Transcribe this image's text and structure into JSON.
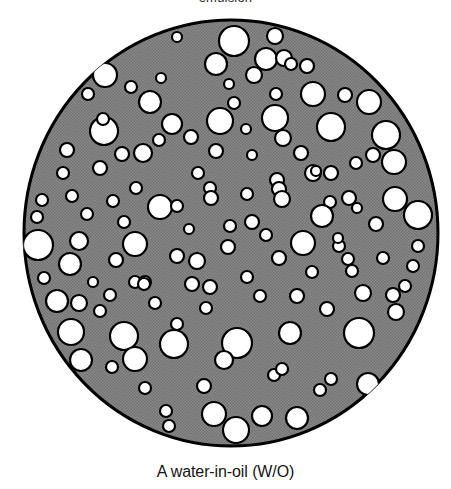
{
  "figure": {
    "top_label": "emulsion",
    "caption": "A water-in-oil (W/O)",
    "alt_description": "A water-in-oil (W/O) emulsion: gray continuous oil phase disc containing dispersed white water droplets"
  },
  "colors": {
    "continuous_phase_gray": "#878787",
    "halftone_dark": "#6e6e6e",
    "outline_black": "#000000",
    "droplet_white": "#ffffff",
    "page_background": "#ffffff",
    "caption_text": "#151515",
    "top_label_text": "#2b2b2b"
  },
  "diagram": {
    "type": "emulsion-schematic",
    "disc": {
      "center_x": 231,
      "center_y": 233,
      "radius": 209,
      "stroke_width": 3,
      "fill_label": "oil (continuous phase)"
    },
    "droplet_label": "water (dispersed phase)",
    "droplet_count": 132,
    "droplet_stroke_width": 2.2,
    "droplets": [
      [
        234,
        45,
        15
      ],
      [
        275,
        40,
        8
      ],
      [
        177,
        41,
        5
      ],
      [
        266,
        63,
        11
      ],
      [
        216,
        68,
        11
      ],
      [
        284,
        62,
        8
      ],
      [
        291,
        68,
        6
      ],
      [
        307,
        70,
        7
      ],
      [
        254,
        79,
        8
      ],
      [
        105,
        79,
        12
      ],
      [
        131,
        91,
        6
      ],
      [
        313,
        98,
        12
      ],
      [
        345,
        99,
        7
      ],
      [
        369,
        106,
        12
      ],
      [
        150,
        106,
        11
      ],
      [
        234,
        107,
        6
      ],
      [
        276,
        98,
        6
      ],
      [
        88,
        98,
        6
      ],
      [
        386,
        139,
        14
      ],
      [
        104,
        135,
        14
      ],
      [
        103,
        123,
        6
      ],
      [
        172,
        128,
        10
      ],
      [
        220,
        125,
        13
      ],
      [
        275,
        122,
        13
      ],
      [
        331,
        131,
        14
      ],
      [
        283,
        142,
        8
      ],
      [
        67,
        154,
        7
      ],
      [
        216,
        155,
        7
      ],
      [
        122,
        158,
        7
      ],
      [
        143,
        157,
        9
      ],
      [
        100,
        172,
        7
      ],
      [
        373,
        159,
        7
      ],
      [
        394,
        166,
        12
      ],
      [
        356,
        167,
        6
      ],
      [
        198,
        177,
        6
      ],
      [
        313,
        177,
        8
      ],
      [
        331,
        177,
        7
      ],
      [
        136,
        192,
        6
      ],
      [
        210,
        192,
        6
      ],
      [
        247,
        198,
        6
      ],
      [
        277,
        184,
        7
      ],
      [
        316,
        175,
        5
      ],
      [
        42,
        204,
        6
      ],
      [
        72,
        200,
        6
      ],
      [
        160,
        211,
        12
      ],
      [
        177,
        210,
        6
      ],
      [
        211,
        202,
        7
      ],
      [
        279,
        193,
        7
      ],
      [
        282,
        203,
        8
      ],
      [
        330,
        206,
        6
      ],
      [
        349,
        202,
        7
      ],
      [
        395,
        203,
        12
      ],
      [
        37,
        221,
        6
      ],
      [
        230,
        230,
        6
      ],
      [
        322,
        220,
        11
      ],
      [
        418,
        219,
        14
      ],
      [
        376,
        228,
        7
      ],
      [
        38,
        249,
        15
      ],
      [
        79,
        245,
        9
      ],
      [
        135,
        248,
        12
      ],
      [
        228,
        251,
        7
      ],
      [
        303,
        247,
        12
      ],
      [
        339,
        250,
        6
      ],
      [
        418,
        250,
        6
      ],
      [
        70,
        268,
        11
      ],
      [
        116,
        264,
        7
      ],
      [
        177,
        260,
        7
      ],
      [
        197,
        265,
        8
      ],
      [
        279,
        262,
        7
      ],
      [
        348,
        263,
        6
      ],
      [
        352,
        275,
        6
      ],
      [
        413,
        270,
        6
      ],
      [
        135,
        286,
        6
      ],
      [
        145,
        286,
        6
      ],
      [
        192,
        288,
        7
      ],
      [
        210,
        291,
        7
      ],
      [
        57,
        305,
        11
      ],
      [
        79,
        307,
        8
      ],
      [
        260,
        300,
        6
      ],
      [
        297,
        300,
        7
      ],
      [
        363,
        297,
        8
      ],
      [
        393,
        299,
        7
      ],
      [
        100,
        315,
        6
      ],
      [
        327,
        313,
        7
      ],
      [
        396,
        316,
        8
      ],
      [
        71,
        336,
        13
      ],
      [
        124,
        340,
        14
      ],
      [
        174,
        348,
        14
      ],
      [
        237,
        347,
        15
      ],
      [
        290,
        337,
        11
      ],
      [
        177,
        328,
        6
      ],
      [
        359,
        337,
        15
      ],
      [
        81,
        364,
        11
      ],
      [
        135,
        363,
        12
      ],
      [
        112,
        371,
        6
      ],
      [
        224,
        364,
        9
      ],
      [
        274,
        379,
        6
      ],
      [
        282,
        373,
        6
      ],
      [
        331,
        383,
        6
      ],
      [
        368,
        388,
        11
      ],
      [
        204,
        390,
        7
      ],
      [
        145,
        392,
        6
      ],
      [
        320,
        394,
        6
      ],
      [
        166,
        415,
        6
      ],
      [
        214,
        418,
        12
      ],
      [
        262,
        420,
        10
      ],
      [
        297,
        422,
        11
      ],
      [
        236,
        434,
        13
      ],
      [
        169,
        430,
        6
      ],
      [
        144,
        288,
        6
      ],
      [
        357,
        212,
        5
      ],
      [
        301,
        157,
        7
      ],
      [
        252,
        159,
        5
      ],
      [
        191,
        141,
        7
      ],
      [
        159,
        144,
        6
      ],
      [
        63,
        177,
        6
      ],
      [
        87,
        218,
        6
      ],
      [
        113,
        205,
        6
      ],
      [
        252,
        226,
        7
      ],
      [
        266,
        239,
        6
      ],
      [
        312,
        276,
        6
      ],
      [
        247,
        281,
        6
      ],
      [
        155,
        307,
        6
      ],
      [
        206,
        312,
        6
      ],
      [
        110,
        299,
        6
      ],
      [
        44,
        282,
        6
      ],
      [
        93,
        286,
        5
      ],
      [
        383,
        262,
        6
      ],
      [
        405,
        290,
        6
      ],
      [
        189,
        233,
        5
      ],
      [
        124,
        226,
        6
      ],
      [
        246,
        133,
        5
      ],
      [
        338,
        242,
        5
      ],
      [
        229,
        88,
        5
      ],
      [
        161,
        82,
        5
      ]
    ]
  }
}
